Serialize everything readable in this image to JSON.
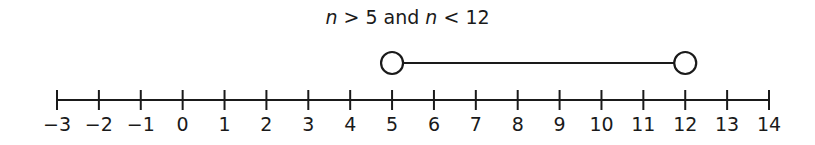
{
  "title": {
    "var1": "n",
    "op1": " > ",
    "val1": "5",
    "conj": " and ",
    "var2": "n",
    "op2": " < ",
    "val2": "12"
  },
  "chart_data": {
    "type": "number_line",
    "title": "n > 5 and n < 12",
    "axis_min": -3,
    "axis_max": 14,
    "ticks": [
      -3,
      -2,
      -1,
      0,
      1,
      2,
      3,
      4,
      5,
      6,
      7,
      8,
      9,
      10,
      11,
      12,
      13,
      14
    ],
    "tick_labels": [
      "−3",
      "−2",
      "−1",
      "0",
      "1",
      "2",
      "3",
      "4",
      "5",
      "6",
      "7",
      "8",
      "9",
      "10",
      "11",
      "12",
      "13",
      "14"
    ],
    "interval": {
      "start": 5,
      "end": 12,
      "start_closed": false,
      "end_closed": false
    }
  },
  "colors": {
    "ink": "#1a1a1a",
    "background": "#ffffff"
  }
}
